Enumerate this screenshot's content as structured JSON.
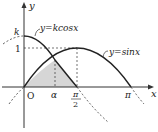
{
  "diagram": {
    "axes": {
      "x_label": "x",
      "y_label": "y",
      "origin_label": "O"
    },
    "y_ticks": {
      "k": "k",
      "one": "1"
    },
    "x_ticks": {
      "alpha": "α",
      "pi_half_num": "π",
      "pi_half_den": "2",
      "pi": "π"
    },
    "curves": {
      "cos_label": "y=kcosx",
      "sin_label": "y=sinx"
    },
    "colors": {
      "curve": "#222222",
      "shade": "#d6d6d6",
      "axis": "#333333"
    }
  }
}
